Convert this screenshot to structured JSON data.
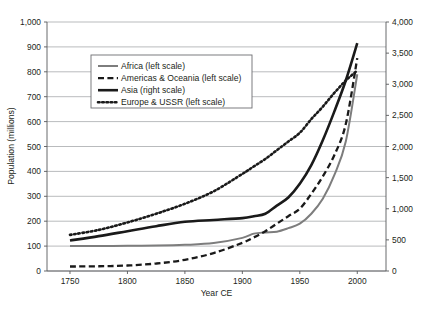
{
  "chart_data": {
    "type": "line",
    "title": "",
    "xlabel": "Year CE",
    "ylabel": "Population (millions)",
    "ylabel_right": "",
    "xlim": [
      1730,
      2025
    ],
    "ylim": [
      0,
      1000
    ],
    "ylim_right": [
      0,
      4000
    ],
    "grid": true,
    "legend_position": "upper left inside",
    "x_ticks": [
      "1750",
      "1800",
      "1850",
      "1900",
      "1950",
      "2000"
    ],
    "x_tick_values": [
      1750,
      1800,
      1850,
      1900,
      1950,
      2000
    ],
    "y_ticks_left": [
      "0",
      "100",
      "200",
      "300",
      "400",
      "500",
      "600",
      "700",
      "800",
      "900",
      "1,000"
    ],
    "y_tick_values_left": [
      0,
      100,
      200,
      300,
      400,
      500,
      600,
      700,
      800,
      900,
      1000
    ],
    "y_ticks_right": [
      "0",
      "500",
      "1,000",
      "1,500",
      "2,000",
      "2,500",
      "3,000",
      "3,500",
      "4,000"
    ],
    "y_tick_values_right": [
      0,
      500,
      1000,
      1500,
      2000,
      2500,
      3000,
      3500,
      4000
    ],
    "x": [
      1750,
      1775,
      1800,
      1825,
      1850,
      1875,
      1900,
      1910,
      1920,
      1930,
      1940,
      1950,
      1960,
      1970,
      1980,
      1990,
      2000
    ],
    "series": [
      {
        "name": "Africa (left scale)",
        "legend_label": "Africa (left scale)",
        "axis": "left",
        "style": "solid",
        "color": "#7d7d7d",
        "width": 2.0,
        "values": [
          100,
          100,
          101,
          102,
          105,
          112,
          133,
          150,
          155,
          158,
          172,
          190,
          230,
          290,
          385,
          520,
          790
        ]
      },
      {
        "name": "Americas & Oceania (left scale)",
        "legend_label": "Americas & Oceania (left scale)",
        "axis": "left",
        "style": "dashed",
        "color": "#1a1a1a",
        "width": 2.3,
        "values": [
          18,
          19,
          22,
          30,
          45,
          72,
          113,
          135,
          160,
          190,
          220,
          250,
          310,
          380,
          465,
          590,
          855
        ]
      },
      {
        "name": "Asia (right scale)",
        "legend_label": "Asia (right scale)",
        "axis": "right",
        "style": "solid",
        "color": "#1a1a1a",
        "width": 2.6,
        "values": [
          490,
          560,
          640,
          720,
          790,
          820,
          850,
          880,
          920,
          1050,
          1180,
          1400,
          1700,
          2100,
          2560,
          3060,
          3660
        ]
      },
      {
        "name": "Europe & USSR (left scale)",
        "legend_label": "Europe & USSR (left scale)",
        "axis": "left",
        "style": "dotted",
        "color": "#1a1a1a",
        "width": 2.6,
        "values": [
          145,
          165,
          195,
          230,
          270,
          320,
          390,
          420,
          450,
          485,
          520,
          555,
          610,
          660,
          715,
          765,
          805
        ]
      }
    ]
  },
  "axes": {
    "x_title": "Year CE",
    "y_title_left": "Population (millions)"
  }
}
